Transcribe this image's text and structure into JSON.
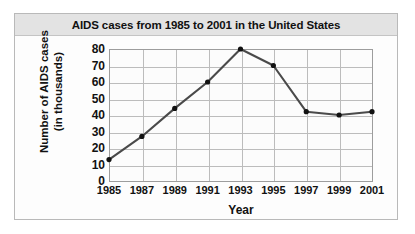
{
  "chart_data": {
    "type": "line",
    "title": "AIDS cases from 1985 to 2001 in the United States",
    "xlabel": "Year",
    "ylabel_line1": "Number of AIDS cases",
    "ylabel_line2": "(in thousands)",
    "categories": [
      1985,
      1987,
      1989,
      1991,
      1993,
      1995,
      1997,
      1999,
      2001
    ],
    "x_tick_labels": [
      "1985",
      "1987",
      "1989",
      "1991",
      "1993",
      "1995",
      "1997",
      "1999",
      "2001"
    ],
    "values": [
      13,
      27,
      44,
      60,
      80,
      70,
      42,
      40,
      42
    ],
    "y_tick_labels": [
      "80",
      "70",
      "60",
      "50",
      "40",
      "30",
      "20",
      "10",
      "0"
    ],
    "y_ticks": [
      80,
      70,
      60,
      50,
      40,
      30,
      20,
      10,
      0
    ],
    "xlim": [
      1985,
      2001
    ],
    "ylim": [
      0,
      80
    ],
    "grid": true,
    "legend": false,
    "marker": "circle",
    "line_color": "#4a4a4a",
    "marker_color": "#121212",
    "grid_color": "#bcbcbc",
    "plot_background": "#fcfcfc",
    "title_band_color": "#e3e3e3",
    "panel_background": "#fdfdfd",
    "border_color": "#b9b9b9"
  }
}
